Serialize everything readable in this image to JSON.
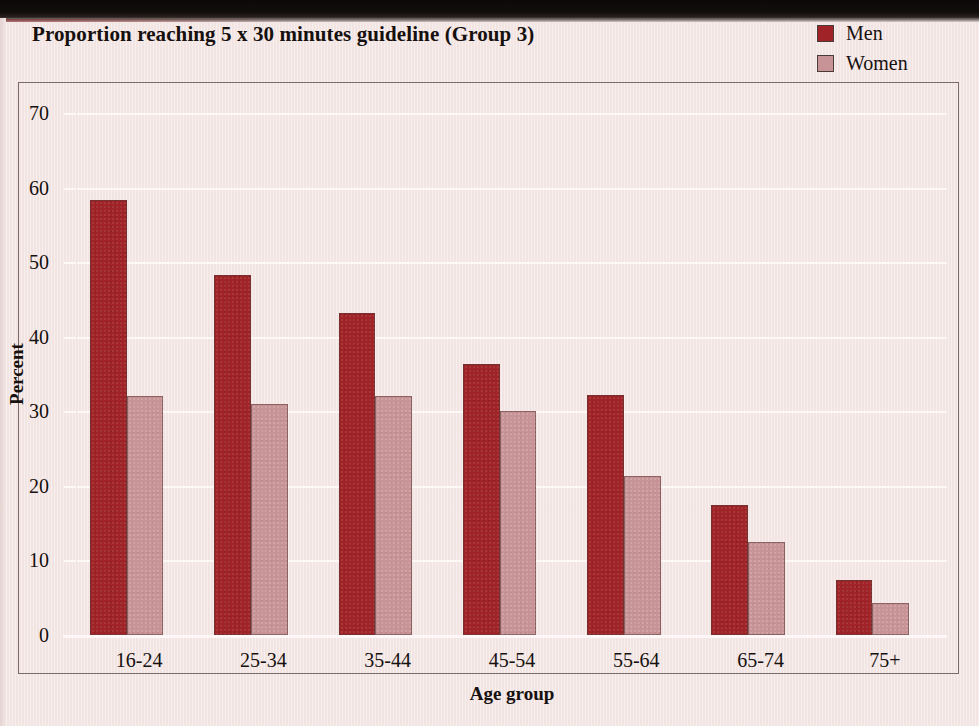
{
  "chart_data": {
    "type": "bar",
    "title": "Proportion reaching 5 x 30 minutes guideline (Group 3)",
    "xlabel": "Age group",
    "ylabel": "Percent",
    "categories": [
      "16-24",
      "25-34",
      "35-44",
      "45-54",
      "55-64",
      "65-74",
      "75+"
    ],
    "series": [
      {
        "name": "Men",
        "color": "#a02327",
        "values": [
          58.3,
          48.3,
          43.2,
          36.3,
          32.2,
          17.4,
          7.4
        ]
      },
      {
        "name": "Women",
        "color": "#c79396",
        "values": [
          32.0,
          31.0,
          32.1,
          30.0,
          21.3,
          12.5,
          4.3
        ]
      }
    ],
    "ylim": [
      0,
      70
    ],
    "yticks": [
      0,
      10,
      20,
      30,
      40,
      50,
      60,
      70
    ],
    "ytick_labels": [
      "0",
      "10",
      "20",
      "30",
      "40",
      "50",
      "60",
      "70"
    ],
    "grid": true,
    "grid_color": "#fdf7f6",
    "legend_position": "top-right",
    "background_color": "#f4e8e6"
  },
  "legend": {
    "items": [
      {
        "label": "Men",
        "color": "#a02327"
      },
      {
        "label": "Women",
        "color": "#c79396"
      }
    ]
  }
}
